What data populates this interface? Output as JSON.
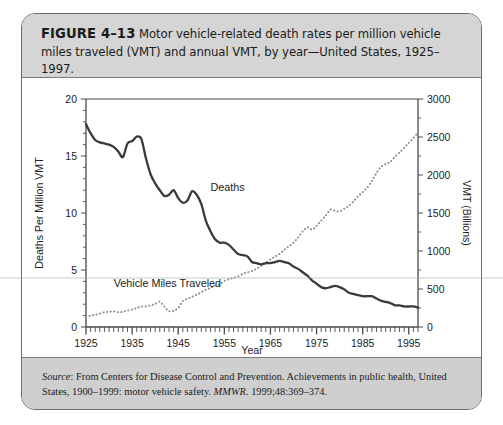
{
  "figure": {
    "label": "FIGURE 4–13",
    "caption": "Motor vehicle-related death rates per million vehicle miles traveled (VMT) and annual VMT, by year—United States, 1925–1997.",
    "source_prefix": "Source",
    "source_text": ": From Centers for Disease Control and Prevention. Achievements in public health, United States, 1900–1999: motor vehicle safety. ",
    "source_journal": "MMWR",
    "source_citation": ". 1999;48:369–374."
  },
  "colors": {
    "frame": "#6d6d6d",
    "caption_band": "#d5d5d5",
    "source_band": "#cfcfcf",
    "deaths_line": "#3a3a3a",
    "vmt_line": "#8c8c8c",
    "axis": "#444444",
    "text": "#1b1b1b"
  },
  "chart_data": {
    "type": "line",
    "title": "",
    "xlabel": "Year",
    "ylabel": "Deaths Per Million VMT",
    "y2label": "VMT (Billions)",
    "xlim": [
      1925,
      1997
    ],
    "ylim": [
      0,
      20
    ],
    "y2lim": [
      0,
      3000
    ],
    "xticks": [
      1925,
      1935,
      1945,
      1955,
      1965,
      1975,
      1985,
      1995
    ],
    "xminor_step": 1,
    "yticks": [
      0,
      5,
      10,
      15,
      20
    ],
    "y2ticks": [
      0,
      500,
      1000,
      1500,
      2000,
      2500,
      3000
    ],
    "grid": false,
    "legend": "inline-annotations",
    "annotations": [
      {
        "text": "Deaths",
        "x": 1952,
        "y": 11.9
      },
      {
        "text": "Vehicle Miles Traveled",
        "x": 1931,
        "y": 3.5
      }
    ],
    "series": [
      {
        "name": "Deaths",
        "axis": "left",
        "units": "deaths per million VMT",
        "style": "solid",
        "x": [
          1925,
          1926,
          1927,
          1928,
          1929,
          1930,
          1931,
          1932,
          1933,
          1934,
          1935,
          1936,
          1937,
          1938,
          1939,
          1940,
          1941,
          1942,
          1943,
          1944,
          1945,
          1946,
          1947,
          1948,
          1949,
          1950,
          1951,
          1952,
          1953,
          1954,
          1955,
          1956,
          1957,
          1958,
          1959,
          1960,
          1961,
          1962,
          1963,
          1964,
          1965,
          1966,
          1967,
          1968,
          1969,
          1970,
          1971,
          1972,
          1973,
          1974,
          1975,
          1976,
          1977,
          1978,
          1979,
          1980,
          1981,
          1982,
          1983,
          1984,
          1985,
          1986,
          1987,
          1988,
          1989,
          1990,
          1991,
          1992,
          1993,
          1994,
          1995,
          1996,
          1997
        ],
        "values": [
          17.8,
          17.0,
          16.4,
          16.2,
          16.1,
          16.0,
          15.8,
          15.4,
          14.9,
          16.1,
          16.3,
          16.7,
          16.5,
          14.8,
          13.4,
          12.6,
          12.0,
          11.5,
          11.6,
          12.0,
          11.3,
          10.9,
          11.1,
          11.9,
          11.6,
          10.8,
          9.3,
          8.4,
          7.7,
          7.4,
          7.4,
          7.2,
          6.8,
          6.4,
          6.3,
          6.2,
          5.7,
          5.6,
          5.5,
          5.6,
          5.6,
          5.7,
          5.8,
          5.7,
          5.6,
          5.3,
          5.1,
          4.8,
          4.5,
          4.1,
          3.8,
          3.5,
          3.4,
          3.5,
          3.6,
          3.5,
          3.3,
          3.0,
          2.9,
          2.8,
          2.7,
          2.7,
          2.7,
          2.5,
          2.3,
          2.2,
          2.1,
          1.9,
          1.9,
          1.8,
          1.8,
          1.8,
          1.7
        ]
      },
      {
        "name": "Vehicle Miles Traveled",
        "axis": "right",
        "units": "billions of vehicle miles",
        "style": "dotted",
        "x": [
          1925,
          1926,
          1927,
          1928,
          1929,
          1930,
          1931,
          1932,
          1933,
          1934,
          1935,
          1936,
          1937,
          1938,
          1939,
          1940,
          1941,
          1942,
          1943,
          1944,
          1945,
          1946,
          1947,
          1948,
          1949,
          1950,
          1951,
          1952,
          1953,
          1954,
          1955,
          1956,
          1957,
          1958,
          1959,
          1960,
          1961,
          1962,
          1963,
          1964,
          1965,
          1966,
          1967,
          1968,
          1969,
          1970,
          1971,
          1972,
          1973,
          1974,
          1975,
          1976,
          1977,
          1978,
          1979,
          1980,
          1981,
          1982,
          1983,
          1984,
          1985,
          1986,
          1987,
          1988,
          1989,
          1990,
          1991,
          1992,
          1993,
          1994,
          1995,
          1996,
          1997
        ],
        "values": [
          130,
          150,
          160,
          175,
          195,
          200,
          205,
          195,
          200,
          215,
          230,
          250,
          270,
          270,
          285,
          302,
          334,
          268,
          208,
          213,
          250,
          341,
          371,
          398,
          424,
          458,
          491,
          514,
          544,
          562,
          606,
          628,
          647,
          665,
          700,
          719,
          737,
          767,
          805,
          846,
          888,
          926,
          965,
          1016,
          1062,
          1110,
          1179,
          1260,
          1313,
          1281,
          1330,
          1402,
          1467,
          1545,
          1529,
          1521,
          1556,
          1595,
          1653,
          1720,
          1775,
          1835,
          1921,
          2026,
          2107,
          2144,
          2172,
          2240,
          2297,
          2358,
          2423,
          2486,
          2560
        ]
      }
    ]
  }
}
